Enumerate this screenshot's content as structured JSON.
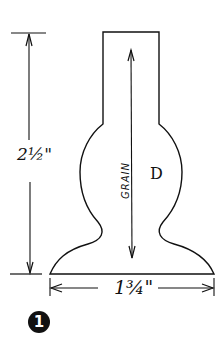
{
  "diagram": {
    "figure_number": "1",
    "height_dimension": "2½\"",
    "width_dimension": "1¾\"",
    "grain_label": "GRAIN",
    "part_label": "D",
    "colors": {
      "ink": "#111111",
      "background": "#ffffff"
    }
  }
}
